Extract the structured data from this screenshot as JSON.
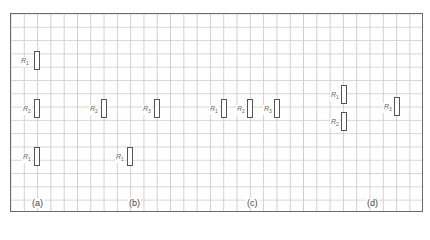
{
  "figure": {
    "grid": {
      "left": 10,
      "top": 13,
      "width": 413,
      "height": 199,
      "cell": 13.3
    },
    "panels": [
      {
        "caption": "(a)",
        "caption_pos": [
          31,
          198
        ],
        "resistors": [
          {
            "label": "R",
            "sub": "1",
            "box": [
              34,
              51
            ],
            "label_pos": [
              20,
              57
            ]
          },
          {
            "label": "R",
            "sub": "2",
            "box": [
              34,
              99
            ],
            "label_pos": [
              22,
              105
            ]
          },
          {
            "label": "R",
            "sub": "1",
            "box": [
              34,
              147
            ],
            "label_pos": [
              22,
              153
            ]
          }
        ]
      },
      {
        "caption": "(b)",
        "caption_pos": [
          128,
          198
        ],
        "resistors": [
          {
            "label": "R",
            "sub": "2",
            "box": [
              101,
              99
            ],
            "label_pos": [
              89,
              105
            ]
          },
          {
            "label": "R",
            "sub": "3",
            "box": [
              154,
              99
            ],
            "label_pos": [
              142,
              105
            ]
          },
          {
            "label": "R",
            "sub": "1",
            "box": [
              127,
              147
            ],
            "label_pos": [
              115,
              153
            ]
          }
        ]
      },
      {
        "caption": "(c)",
        "caption_pos": [
          246,
          198
        ],
        "resistors": [
          {
            "label": "R",
            "sub": "1",
            "box": [
              221,
              99
            ],
            "label_pos": [
              209,
              105
            ]
          },
          {
            "label": "R",
            "sub": "2",
            "box": [
              247,
              99
            ],
            "label_pos": [
              236,
              105
            ]
          },
          {
            "label": "R",
            "sub": "3",
            "box": [
              274,
              99
            ],
            "label_pos": [
              263,
              105
            ]
          }
        ]
      },
      {
        "caption": "(d)",
        "caption_pos": [
          366,
          198
        ],
        "resistors": [
          {
            "label": "R",
            "sub": "1",
            "box": [
              341,
              85
            ],
            "label_pos": [
              330,
              91
            ]
          },
          {
            "label": "R",
            "sub": "2",
            "box": [
              341,
              112
            ],
            "label_pos": [
              330,
              118
            ]
          },
          {
            "label": "R",
            "sub": "3",
            "box": [
              394,
              97
            ],
            "label_pos": [
              383,
              103
            ]
          }
        ]
      }
    ]
  }
}
